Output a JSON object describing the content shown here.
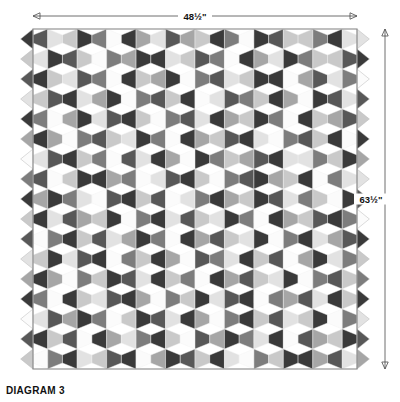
{
  "diagram": {
    "caption": "DIAGRAM 3",
    "width_label": "48½\"",
    "height_label": "63½\"",
    "width_inches": 48.5,
    "height_inches": 63.5,
    "shape_type": "elongated hexagon",
    "columns": 11,
    "rows": 17,
    "palette": {
      "white": "#fbfbfb",
      "light": "#e2e2e2",
      "light_mid": "#c9c9c9",
      "mid": "#a6a6a6",
      "mid_dark": "#7d7d7d",
      "dark": "#585858",
      "darkest": "#3a3a3a",
      "outline": "#8a8a8a",
      "background": "#ffffff",
      "text": "#111111"
    },
    "geometry": {
      "quilt_left": 33,
      "quilt_right": 357,
      "quilt_top": 29,
      "quilt_bottom": 369,
      "top_arrow_y": 16,
      "right_arrow_x": 385,
      "caption_x": 6,
      "caption_y": 394
    },
    "shade_keys": [
      "white",
      "light",
      "light_mid",
      "mid",
      "mid_dark",
      "dark",
      "darkest"
    ],
    "half_hex_rows_left": 17,
    "half_hex_rows_right": 17,
    "patch_grid": [
      [
        [
          5,
          1
        ],
        [
          2,
          6
        ],
        [
          4,
          0
        ],
        [
          6,
          3
        ],
        [
          1,
          5
        ],
        [
          3,
          2
        ],
        [
          6,
          4
        ],
        [
          0,
          6
        ],
        [
          5,
          2
        ],
        [
          2,
          4
        ],
        [
          6,
          1
        ]
      ],
      [
        [
          1,
          6
        ],
        [
          5,
          2
        ],
        [
          0,
          4
        ],
        [
          3,
          6
        ],
        [
          6,
          1
        ],
        [
          2,
          5
        ],
        [
          4,
          0
        ],
        [
          6,
          3
        ],
        [
          1,
          6
        ],
        [
          4,
          2
        ],
        [
          2,
          5
        ]
      ],
      [
        [
          6,
          2
        ],
        [
          1,
          5
        ],
        [
          4,
          0
        ],
        [
          6,
          2
        ],
        [
          3,
          6
        ],
        [
          0,
          4
        ],
        [
          5,
          1
        ],
        [
          2,
          6
        ],
        [
          6,
          0
        ],
        [
          3,
          5
        ],
        [
          1,
          4
        ]
      ],
      [
        [
          2,
          5
        ],
        [
          6,
          1
        ],
        [
          3,
          6
        ],
        [
          0,
          4
        ],
        [
          5,
          2
        ],
        [
          6,
          0
        ],
        [
          1,
          5
        ],
        [
          4,
          2
        ],
        [
          6,
          3
        ],
        [
          0,
          6
        ],
        [
          5,
          1
        ]
      ],
      [
        [
          4,
          0
        ],
        [
          3,
          6
        ],
        [
          1,
          5
        ],
        [
          6,
          2
        ],
        [
          0,
          4
        ],
        [
          5,
          1
        ],
        [
          6,
          3
        ],
        [
          2,
          6
        ],
        [
          4,
          0
        ],
        [
          6,
          2
        ],
        [
          3,
          5
        ]
      ],
      [
        [
          6,
          3
        ],
        [
          0,
          4
        ],
        [
          5,
          2
        ],
        [
          1,
          6
        ],
        [
          4,
          0
        ],
        [
          6,
          3
        ],
        [
          2,
          5
        ],
        [
          6,
          1
        ],
        [
          0,
          4
        ],
        [
          5,
          2
        ],
        [
          6,
          0
        ]
      ],
      [
        [
          1,
          5
        ],
        [
          6,
          2
        ],
        [
          4,
          0
        ],
        [
          5,
          1
        ],
        [
          6,
          3
        ],
        [
          0,
          6
        ],
        [
          4,
          2
        ],
        [
          3,
          5
        ],
        [
          6,
          1
        ],
        [
          1,
          4
        ],
        [
          2,
          6
        ]
      ],
      [
        [
          5,
          0
        ],
        [
          2,
          6
        ],
        [
          6,
          3
        ],
        [
          4,
          0
        ],
        [
          1,
          5
        ],
        [
          6,
          2
        ],
        [
          0,
          4
        ],
        [
          5,
          6
        ],
        [
          3,
          2
        ],
        [
          6,
          0
        ],
        [
          4,
          1
        ]
      ],
      [
        [
          3,
          6
        ],
        [
          4,
          1
        ],
        [
          0,
          5
        ],
        [
          6,
          2
        ],
        [
          5,
          0
        ],
        [
          1,
          4
        ],
        [
          6,
          3
        ],
        [
          2,
          6
        ],
        [
          5,
          1
        ],
        [
          4,
          2
        ],
        [
          0,
          6
        ]
      ],
      [
        [
          6,
          1
        ],
        [
          5,
          3
        ],
        [
          2,
          6
        ],
        [
          0,
          4
        ],
        [
          6,
          1
        ],
        [
          5,
          2
        ],
        [
          1,
          6
        ],
        [
          4,
          0
        ],
        [
          6,
          3
        ],
        [
          2,
          5
        ],
        [
          6,
          4
        ]
      ],
      [
        [
          0,
          4
        ],
        [
          6,
          2
        ],
        [
          5,
          1
        ],
        [
          3,
          6
        ],
        [
          4,
          0
        ],
        [
          6,
          3
        ],
        [
          5,
          2
        ],
        [
          1,
          6
        ],
        [
          0,
          4
        ],
        [
          6,
          1
        ],
        [
          3,
          5
        ]
      ],
      [
        [
          2,
          6
        ],
        [
          1,
          5
        ],
        [
          6,
          0
        ],
        [
          4,
          2
        ],
        [
          6,
          3
        ],
        [
          0,
          5
        ],
        [
          4,
          1
        ],
        [
          6,
          2
        ],
        [
          5,
          0
        ],
        [
          3,
          6
        ],
        [
          1,
          4
        ]
      ],
      [
        [
          6,
          3
        ],
        [
          0,
          4
        ],
        [
          2,
          6
        ],
        [
          5,
          1
        ],
        [
          6,
          2
        ],
        [
          4,
          0
        ],
        [
          6,
          3
        ],
        [
          5,
          2
        ],
        [
          1,
          6
        ],
        [
          0,
          4
        ],
        [
          5,
          2
        ]
      ],
      [
        [
          4,
          0
        ],
        [
          6,
          2
        ],
        [
          1,
          5
        ],
        [
          6,
          3
        ],
        [
          0,
          4
        ],
        [
          2,
          6
        ],
        [
          1,
          5
        ],
        [
          6,
          0
        ],
        [
          4,
          3
        ],
        [
          5,
          1
        ],
        [
          6,
          2
        ]
      ],
      [
        [
          1,
          5
        ],
        [
          3,
          6
        ],
        [
          4,
          0
        ],
        [
          2,
          6
        ],
        [
          5,
          1
        ],
        [
          6,
          3
        ],
        [
          0,
          4
        ],
        [
          6,
          2
        ],
        [
          5,
          1
        ],
        [
          2,
          6
        ],
        [
          0,
          4
        ]
      ],
      [
        [
          6,
          2
        ],
        [
          5,
          0
        ],
        [
          6,
          3
        ],
        [
          1,
          4
        ],
        [
          6,
          2
        ],
        [
          0,
          5
        ],
        [
          3,
          6
        ],
        [
          4,
          1
        ],
        [
          6,
          0
        ],
        [
          5,
          3
        ],
        [
          2,
          6
        ]
      ],
      [
        [
          0,
          4
        ],
        [
          6,
          1
        ],
        [
          2,
          5
        ],
        [
          6,
          0
        ],
        [
          3,
          6
        ],
        [
          5,
          2
        ],
        [
          6,
          1
        ],
        [
          0,
          4
        ],
        [
          2,
          6
        ],
        [
          6,
          3
        ],
        [
          5,
          1
        ]
      ]
    ],
    "left_edge_shades": [
      6,
      2,
      5,
      1,
      6,
      3,
      0,
      4,
      6,
      2,
      5,
      1,
      3,
      6,
      0,
      5,
      2
    ],
    "right_edge_shades": [
      1,
      6,
      0,
      5,
      2,
      6,
      3,
      1,
      5,
      0,
      6,
      2,
      4,
      6,
      1,
      5,
      3
    ]
  }
}
